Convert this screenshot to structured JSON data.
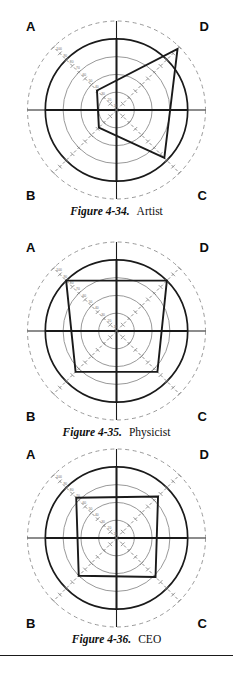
{
  "page": {
    "background": "#ffffff",
    "axis_color": "#1a1a1a",
    "grid_color": "#8d8d8d",
    "dashed_color": "#9a9a9a",
    "data_color": "#1a1a1a",
    "tick_axis_color": "#7a7a7a",
    "rule_present": true
  },
  "axis_labels": {
    "top_left": "A",
    "top_right": "D",
    "bottom_left": "B",
    "bottom_right": "C"
  },
  "scale": {
    "ticks": [
      "100",
      "90",
      "80",
      "70",
      "60",
      "50",
      "40",
      "30",
      "20",
      "10"
    ],
    "max": 100,
    "min": 0
  },
  "figures": [
    {
      "id": "figure-4-34",
      "number": "Figure 4-34.",
      "title": "Artist",
      "chart_data": {
        "type": "radar",
        "title": "Artist",
        "categories": [
          "A",
          "D",
          "C",
          "B"
        ],
        "values": [
          31,
          97,
          76,
          28
        ],
        "max": 100,
        "rings": [
          100,
          80,
          60,
          40,
          20
        ],
        "legend": "none",
        "grid": true
      }
    },
    {
      "id": "figure-4-35",
      "number": "Figure 4-35.",
      "title": "Physicist",
      "chart_data": {
        "type": "radar",
        "title": "Physicist",
        "categories": [
          "A",
          "D",
          "C",
          "B"
        ],
        "values": [
          80,
          80,
          65,
          65
        ],
        "max": 100,
        "rings": [
          100,
          80,
          60,
          40,
          20
        ],
        "legend": "none",
        "grid": true
      }
    },
    {
      "id": "figure-4-36",
      "number": "Figure 4-36.",
      "title": "CEO",
      "chart_data": {
        "type": "radar",
        "title": "CEO",
        "categories": [
          "A",
          "D",
          "C",
          "B"
        ],
        "values": [
          64,
          66,
          62,
          60
        ],
        "max": 100,
        "rings": [
          100,
          80,
          60,
          40,
          20
        ],
        "legend": "none",
        "grid": true
      }
    }
  ]
}
